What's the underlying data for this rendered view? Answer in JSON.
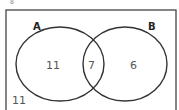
{
  "corner_mark": "8",
  "venn": {
    "sets": [
      {
        "name": "A",
        "only": "11"
      },
      {
        "name": "B",
        "only": "6"
      }
    ],
    "intersection": "7",
    "outside": "11"
  }
}
